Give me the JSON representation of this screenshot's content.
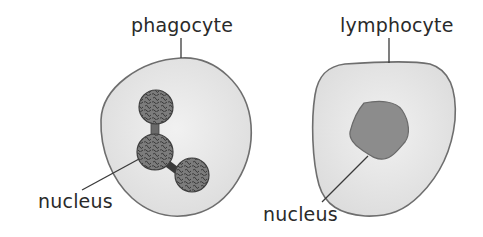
{
  "diagram": {
    "cells": [
      {
        "name": "phagocyte",
        "label": "phagocyte",
        "nucleus_label": "nucleus",
        "nucleus_shape": "multi-lobed (3 lobes)"
      },
      {
        "name": "lymphocyte",
        "label": "lymphocyte",
        "nucleus_label": "nucleus",
        "nucleus_shape": "single large"
      }
    ],
    "colors": {
      "cytoplasm": "#e4e4e4",
      "outline": "#6e6e6e",
      "nucleus_fill": "#8a8a8a",
      "nucleus_texture": "#3c3c3c",
      "text": "#2a2a2a"
    }
  }
}
